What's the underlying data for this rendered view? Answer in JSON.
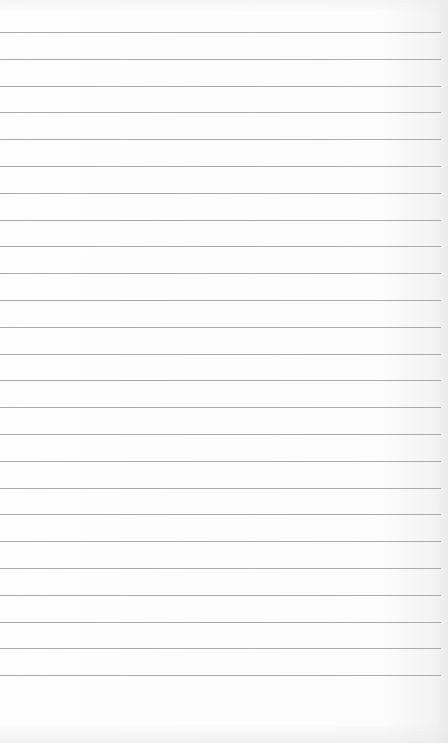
{
  "paper": {
    "type": "lined-paper",
    "background_color": "#fdfdfd",
    "rule_color": "#ababab",
    "rule_count": 25,
    "first_rule_y": 32,
    "rule_spacing": 26.8,
    "rule_width": 441
  }
}
